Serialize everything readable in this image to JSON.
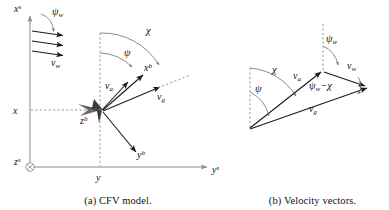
{
  "figure": {
    "panels": [
      {
        "id": "a",
        "caption": "(a) CFV model.",
        "axes": [
          {
            "name": "x-superscript-s",
            "label": "x",
            "sup": "s"
          },
          {
            "name": "y-superscript-s",
            "label": "y",
            "sup": "s"
          },
          {
            "name": "z-superscript-s",
            "label": "z",
            "sup": "s",
            "icon": "circled-cross-icon"
          }
        ],
        "position_ticks": [
          {
            "name": "x-position-tick",
            "label": "x"
          },
          {
            "name": "y-position-tick",
            "label": "y"
          }
        ],
        "body_axes": [
          {
            "name": "x-body-axis",
            "label": "x",
            "sup": "b"
          },
          {
            "name": "y-body-axis",
            "label": "y",
            "sup": "b"
          },
          {
            "name": "z-body-axis",
            "label": "z",
            "sup": "b"
          }
        ],
        "vectors": [
          {
            "name": "wind-velocity-vector",
            "label": "v",
            "sub": "w"
          },
          {
            "name": "air-velocity-vector",
            "label": "v",
            "sub": "a"
          },
          {
            "name": "ground-velocity-vector",
            "label": "v",
            "sub": "g"
          }
        ],
        "angles": [
          {
            "name": "wind-direction-angle",
            "label": "ψ",
            "sub": "w"
          },
          {
            "name": "heading-angle",
            "label": "ψ"
          },
          {
            "name": "course-angle",
            "label": "χ"
          }
        ]
      },
      {
        "id": "b",
        "caption": "(b) Velocity vectors.",
        "vectors": [
          {
            "name": "air-velocity-vector",
            "label": "v",
            "sub": "a"
          },
          {
            "name": "wind-velocity-vector",
            "label": "v",
            "sub": "w"
          },
          {
            "name": "ground-velocity-vector",
            "label": "v",
            "sub": "g"
          }
        ],
        "angles": [
          {
            "name": "course-angle",
            "label": "χ"
          },
          {
            "name": "heading-angle",
            "label": "ψ"
          },
          {
            "name": "wind-direction-angle",
            "label": "ψ",
            "sub": "w"
          },
          {
            "name": "wind-minus-course-angle",
            "label": "ψ",
            "sub": "w",
            "tail": "−χ"
          }
        ]
      }
    ]
  },
  "colors": {
    "ink": "#1a1a1a",
    "axis_gray": "#8a8a8a",
    "dash_gray": "#9a9a9a",
    "arc_gray": "#6f6f6f",
    "craft_dark": "#3a3a3a",
    "craft_light": "#6b6b6b"
  }
}
